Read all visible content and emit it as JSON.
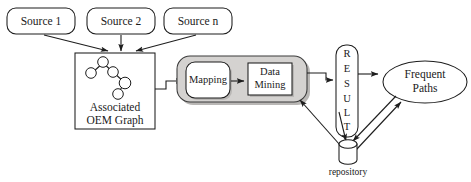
{
  "diagram": {
    "background_color": "#ffffff",
    "stroke_color": "#1d1d1d",
    "gray_fill": "#d4d2d0",
    "white_fill": "#ffffff"
  },
  "sources": [
    {
      "label": "Source 1"
    },
    {
      "label": "Source 2"
    },
    {
      "label": "Source n"
    }
  ],
  "graph_box": {
    "line1": "Associated",
    "line2": "OEM Graph",
    "node_count": 6
  },
  "process": {
    "mapping_label": "Mapping",
    "mining_line1": "Data",
    "mining_line2": "Mining"
  },
  "result": {
    "letters": [
      "R",
      "E",
      "S",
      "U",
      "L",
      "T"
    ],
    "label": "RESULT"
  },
  "repository": {
    "label": "repository"
  },
  "output": {
    "line1": "Frequent",
    "line2": "Paths"
  }
}
